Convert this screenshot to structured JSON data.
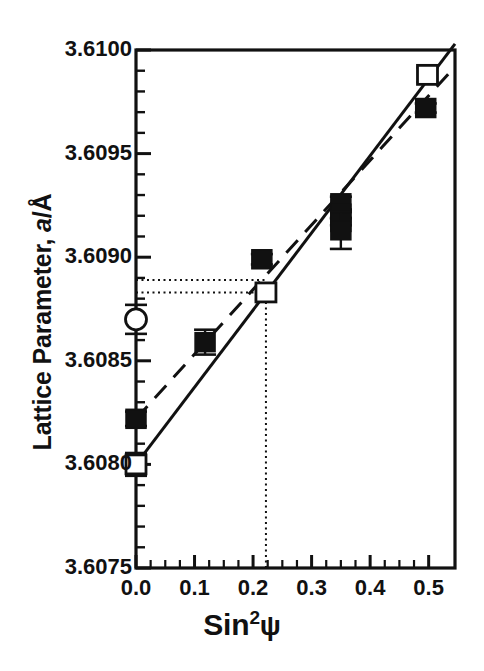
{
  "chart_data": {
    "type": "scatter",
    "title": "",
    "xlabel": "Sin²ψ",
    "ylabel": "Lattice Parameter, a/Å",
    "xlim": [
      0.0,
      0.545
    ],
    "ylim": [
      3.6075,
      3.61
    ],
    "grid": false,
    "legend_position": "none",
    "xticks": [
      0.0,
      0.1,
      0.2,
      0.3,
      0.4,
      0.5
    ],
    "xticklabels": [
      "0.0",
      "0.1",
      "0.2",
      "0.3",
      "0.4",
      "0.5"
    ],
    "x_minor_tick_step": 0.025,
    "yticks": [
      3.6075,
      3.608,
      3.6085,
      3.609,
      3.6095,
      3.61
    ],
    "yticklabels": [
      "3.6075",
      "3.6080",
      "3.6085",
      "3.6090",
      "3.6095",
      "3.6100"
    ],
    "y_minor_tick_step": 0.0001,
    "series": [
      {
        "name": "filled-squares",
        "marker": "filled-square",
        "color": "#000000",
        "points": [
          {
            "x": 0.0,
            "y": 3.60822,
            "yerr": 3.5e-05
          },
          {
            "x": 0.118,
            "y": 3.60859,
            "yerr": 6e-05
          },
          {
            "x": 0.215,
            "y": 3.60899,
            "yerr": 2.5e-05
          },
          {
            "x": 0.35,
            "y": 3.60926,
            "yerr": 3.2e-05
          },
          {
            "x": 0.35,
            "y": 3.60921,
            "yerr": 2e-05
          },
          {
            "x": 0.35,
            "y": 3.60917,
            "yerr": 1.6e-05
          },
          {
            "x": 0.35,
            "y": 3.60913,
            "yerr": 9e-05
          },
          {
            "x": 0.495,
            "y": 3.60972,
            "yerr": 2.2e-05
          }
        ]
      },
      {
        "name": "open-squares",
        "marker": "open-square",
        "color": "#000000",
        "points": [
          {
            "x": 0.0,
            "y": 3.608,
            "yerr": 5.5e-05
          },
          {
            "x": 0.222,
            "y": 3.60883,
            "yerr": 3.5e-05
          },
          {
            "x": 0.498,
            "y": 3.60988,
            "yerr": 3.5e-05
          }
        ]
      },
      {
        "name": "open-circle",
        "marker": "open-circle",
        "color": "#000000",
        "points": [
          {
            "x": 0.0,
            "y": 3.6087,
            "yerr": 7e-05
          }
        ]
      }
    ],
    "fit_lines": [
      {
        "name": "solid-fit-line",
        "style": "solid",
        "x": [
          0.0,
          0.545
        ],
        "y": [
          3.608,
          3.61003
        ]
      },
      {
        "name": "dashed-fit-line",
        "style": "dashed",
        "x": [
          0.0,
          0.545
        ],
        "y": [
          3.60822,
          3.60992
        ]
      }
    ],
    "guide_lines": [
      {
        "name": "upper-horizontal-guide",
        "style": "dotted",
        "orientation": "horizontal",
        "y": 3.60889,
        "x_from": 0.0,
        "x_to": 0.222
      },
      {
        "name": "lower-horizontal-guide",
        "style": "dotted",
        "orientation": "horizontal",
        "y": 3.60883,
        "x_from": 0.0,
        "x_to": 0.222
      },
      {
        "name": "vertical-guide",
        "style": "dotted",
        "orientation": "vertical",
        "x": 0.222,
        "y_from": 3.6075,
        "y_to": 3.60883
      }
    ]
  },
  "axes": {
    "y_label_text": "Lattice Parameter, ",
    "y_label_italic": "a",
    "y_label_tail": "/Å",
    "x_label_base": "Sin",
    "x_label_sup": "2",
    "x_label_psi": "ψ",
    "ytick_labels": [
      "3.6100",
      "3.6095",
      "3.6090",
      "3.6085",
      "3.6080",
      "3.6075"
    ],
    "xtick_labels": [
      "0.0",
      "0.1",
      "0.2",
      "0.3",
      "0.4",
      "0.5"
    ]
  }
}
